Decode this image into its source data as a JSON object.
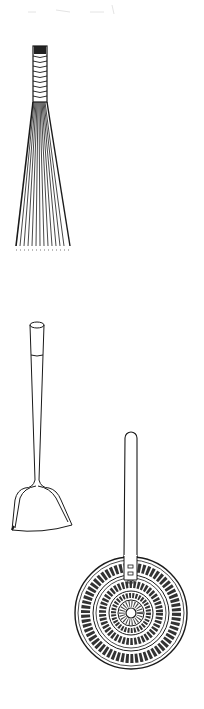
{
  "illustration": {
    "description": "Line drawings of three kitchen utensils on white background",
    "background": "#ffffff",
    "ink": "#1a1a1a",
    "items": [
      {
        "name": "whisk-brush",
        "label": "bundled bamboo brush whisk"
      },
      {
        "name": "spatula",
        "label": "long-handled spatula"
      },
      {
        "name": "strainer",
        "label": "wire mesh spider strainer"
      }
    ]
  }
}
